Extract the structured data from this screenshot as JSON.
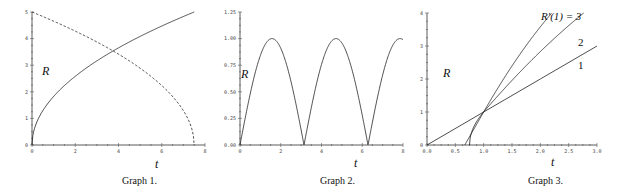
{
  "chart_data": [
    {
      "type": "line",
      "caption": "Graph 1.",
      "xlabel": "t",
      "ylabel": "R",
      "xlim": [
        0,
        8
      ],
      "ylim": [
        0,
        5
      ],
      "xticks": [
        "0",
        "2",
        "4",
        "6",
        "8"
      ],
      "yticks": [
        "0",
        "1",
        "2",
        "3",
        "4",
        "5"
      ],
      "grid": false,
      "series": [
        {
          "name": "solid (increasing)",
          "style": "solid",
          "x": [
            0,
            0.5,
            1,
            2,
            3,
            3.8,
            5,
            6,
            7,
            7.5
          ],
          "y": [
            0,
            1.29,
            1.83,
            2.58,
            3.16,
            3.56,
            4.08,
            4.47,
            4.83,
            5.0
          ]
        },
        {
          "name": "dashed (decreasing)",
          "style": "dashed",
          "x": [
            0,
            1,
            2,
            3,
            3.8,
            5,
            6,
            7,
            7.4,
            7.5
          ],
          "y": [
            5.0,
            4.65,
            4.28,
            3.87,
            3.49,
            2.89,
            2.24,
            1.29,
            0.58,
            0
          ]
        }
      ]
    },
    {
      "type": "line",
      "caption": "Graph 2.",
      "xlabel": "t",
      "ylabel": "R",
      "xlim": [
        0,
        8
      ],
      "ylim": [
        0,
        1.25
      ],
      "xticks": [
        "0",
        "2",
        "4",
        "6",
        "8"
      ],
      "yticks": [
        "0.00",
        "0.25",
        "0.50",
        "0.75",
        "1.00",
        "1.25"
      ],
      "grid": false,
      "series": [
        {
          "name": "|sin t|",
          "style": "solid",
          "function": "abs(sin(t))",
          "x": [
            0,
            1.571,
            3.142,
            4.712,
            6.283,
            7.854,
            8
          ],
          "y": [
            0,
            1,
            0,
            1,
            0,
            1,
            0.99
          ]
        }
      ]
    },
    {
      "type": "line",
      "caption": "Graph 3.",
      "xlabel": "t",
      "ylabel": "R",
      "xlim": [
        0,
        3.0
      ],
      "ylim": [
        0,
        4
      ],
      "xticks": [
        "0.0",
        "0.5",
        "1.0",
        "1.5",
        "2.0",
        "2.5",
        "3.0"
      ],
      "yticks": [
        "0",
        "1",
        "2",
        "3",
        "4"
      ],
      "grid": false,
      "annotations": [
        "R'(1) = 3",
        "2",
        "1"
      ],
      "series": [
        {
          "name": "R'(1) = 3",
          "style": "solid",
          "x": [
            0.667,
            0.8,
            1.0,
            1.5,
            2.0,
            2.33
          ],
          "y": [
            0,
            0.66,
            1.0,
            2.31,
            3.3,
            4.0
          ]
        },
        {
          "name": "R'(1) = 2",
          "style": "solid",
          "x": [
            0.75,
            0.85,
            1.0,
            1.5,
            2.0,
            2.5,
            3.0
          ],
          "y": [
            0,
            0.62,
            1.0,
            1.87,
            2.65,
            3.34,
            4.0
          ]
        },
        {
          "name": "R'(1) = 1",
          "style": "solid",
          "x": [
            0,
            1,
            2,
            3
          ],
          "y": [
            0,
            1,
            2,
            3
          ]
        }
      ]
    }
  ],
  "labels": {
    "g1": {
      "caption": "Graph 1.",
      "x": "t",
      "y": "R"
    },
    "g2": {
      "caption": "Graph 2.",
      "x": "t",
      "y": "R"
    },
    "g3": {
      "caption": "Graph 3.",
      "x": "t",
      "y": "R",
      "ann3": "R′(1) = 3",
      "ann2": "2",
      "ann1": "1"
    }
  },
  "ticks": {
    "g1x": [
      "0",
      "2",
      "4",
      "6",
      "8"
    ],
    "g1y": [
      "0",
      "1",
      "2",
      "3",
      "4",
      "5"
    ],
    "g2x": [
      "0",
      "2",
      "4",
      "6",
      "8"
    ],
    "g2y": [
      "0.00",
      "0.25",
      "0.50",
      "0.75",
      "1.00",
      "1.25"
    ],
    "g3x": [
      "0.0",
      "0.5",
      "1.0",
      "1.5",
      "2.0",
      "2.5",
      "3.0"
    ],
    "g3y": [
      "0",
      "1",
      "2",
      "3",
      "4"
    ]
  }
}
